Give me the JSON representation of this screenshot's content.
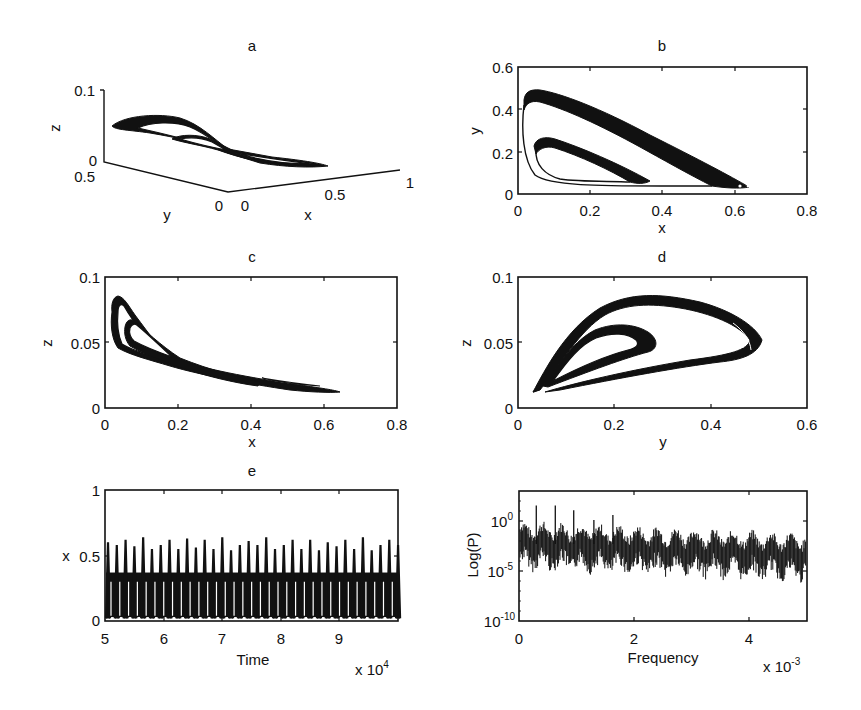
{
  "figure": {
    "panels": {
      "a": {
        "title": "a",
        "xlabel": "x",
        "ylabel": "y",
        "zlabel": "z",
        "x_ticks": [
          "0",
          "0.5",
          "1"
        ],
        "y_ticks": [
          "0",
          "0.5"
        ],
        "z_ticks": [
          "0",
          "0.1"
        ]
      },
      "b": {
        "title": "b",
        "xlabel": "x",
        "ylabel": "y",
        "x_ticks": [
          "0",
          "0.2",
          "0.4",
          "0.6",
          "0.8"
        ],
        "y_ticks": [
          "0",
          "0.2",
          "0.4",
          "0.6"
        ]
      },
      "c": {
        "title": "c",
        "xlabel": "x",
        "ylabel": "z",
        "x_ticks": [
          "0",
          "0.2",
          "0.4",
          "0.6",
          "0.8"
        ],
        "y_ticks": [
          "0",
          "0.05",
          "0.1"
        ]
      },
      "d": {
        "title": "d",
        "xlabel": "y",
        "ylabel": "z",
        "x_ticks": [
          "0",
          "0.2",
          "0.4",
          "0.6"
        ],
        "y_ticks": [
          "0",
          "0.05",
          "0.1"
        ]
      },
      "e": {
        "title": "e",
        "xlabel": "Time",
        "ylabel": "x",
        "x_multiplier": "x 10",
        "x_multiplier_exp": "4",
        "x_ticks": [
          "5",
          "6",
          "7",
          "8",
          "9"
        ],
        "y_ticks": [
          "0",
          "0.5",
          "1"
        ]
      },
      "f": {
        "title": "",
        "xlabel": "Frequency",
        "ylabel": "Log(P)",
        "x_multiplier": "x 10",
        "x_multiplier_exp": "-3",
        "x_ticks": [
          "0",
          "2",
          "4"
        ],
        "y_ticks": [
          {
            "base": "10",
            "exp": "0"
          },
          {
            "base": "10",
            "exp": "-5"
          },
          {
            "base": "10",
            "exp": "-10"
          }
        ]
      }
    }
  },
  "chart_data": [
    {
      "panel": "a",
      "type": "line",
      "title": "a",
      "description": "3D phase-space trajectory of a chaotic attractor (x, y, z)",
      "xlabel": "x",
      "ylabel": "y",
      "zlabel": "z",
      "xlim": [
        0,
        1
      ],
      "ylim": [
        0,
        0.5
      ],
      "zlim": [
        0,
        0.1
      ],
      "grid": false
    },
    {
      "panel": "b",
      "type": "line",
      "title": "b",
      "description": "Projection of attractor onto x-y plane; two nested loops",
      "xlabel": "x",
      "ylabel": "y",
      "xlim": [
        0,
        0.8
      ],
      "ylim": [
        0,
        0.6
      ],
      "grid": false,
      "outer_loop": {
        "x": [
          0.02,
          0.04,
          0.2,
          0.4,
          0.64,
          0.55,
          0.3,
          0.1,
          0.02
        ],
        "y": [
          0.4,
          0.49,
          0.4,
          0.25,
          0.04,
          0.04,
          0.05,
          0.08,
          0.4
        ]
      },
      "inner_loop": {
        "x": [
          0.05,
          0.08,
          0.2,
          0.4,
          0.35,
          0.1,
          0.05
        ],
        "y": [
          0.22,
          0.27,
          0.2,
          0.06,
          0.05,
          0.1,
          0.22
        ]
      }
    },
    {
      "panel": "c",
      "type": "line",
      "title": "c",
      "description": "Projection of attractor onto x-z plane",
      "xlabel": "x",
      "ylabel": "z",
      "xlim": [
        0,
        0.8
      ],
      "ylim": [
        0,
        0.1
      ],
      "grid": false,
      "outer_loop": {
        "x": [
          0.02,
          0.03,
          0.1,
          0.2,
          0.4,
          0.64,
          0.4,
          0.2,
          0.05,
          0.02
        ],
        "z": [
          0.07,
          0.083,
          0.055,
          0.035,
          0.025,
          0.012,
          0.015,
          0.025,
          0.045,
          0.07
        ]
      },
      "inner_loop": {
        "x": [
          0.05,
          0.06,
          0.15,
          0.38,
          0.2,
          0.06,
          0.05
        ],
        "z": [
          0.055,
          0.064,
          0.045,
          0.02,
          0.03,
          0.045,
          0.055
        ]
      }
    },
    {
      "panel": "d",
      "type": "line",
      "title": "d",
      "description": "Projection of attractor onto y-z plane",
      "xlabel": "y",
      "ylabel": "z",
      "xlim": [
        0,
        0.6
      ],
      "ylim": [
        0,
        0.1
      ],
      "grid": false,
      "outer_loop": {
        "y": [
          0.03,
          0.1,
          0.25,
          0.4,
          0.49,
          0.4,
          0.2,
          0.03
        ],
        "z": [
          0.012,
          0.06,
          0.085,
          0.07,
          0.048,
          0.037,
          0.025,
          0.012
        ]
      },
      "inner_loop": {
        "y": [
          0.05,
          0.12,
          0.2,
          0.27,
          0.2,
          0.05
        ],
        "z": [
          0.02,
          0.06,
          0.064,
          0.05,
          0.037,
          0.02
        ]
      }
    },
    {
      "panel": "e",
      "type": "line",
      "title": "e",
      "description": "Time series of x; quasi-periodic bursts with ~34 peaks between t=5e4 and 1e5",
      "xlabel": "Time (x 10^4)",
      "ylabel": "x",
      "xlim": [
        5,
        10
      ],
      "ylim": [
        0,
        1
      ],
      "grid": false,
      "x": [
        5.0,
        5.15,
        5.3,
        5.45,
        5.6,
        5.75,
        5.9,
        6.05,
        6.2,
        6.35,
        6.5,
        6.65,
        6.8,
        6.95,
        7.1,
        7.25,
        7.4,
        7.55,
        7.7,
        7.85,
        8.0,
        8.15,
        8.3,
        8.45,
        8.6,
        8.75,
        8.9,
        9.05,
        9.2,
        9.35,
        9.5,
        9.65,
        9.8,
        9.95
      ],
      "peak_values": [
        0.6,
        0.58,
        0.62,
        0.57,
        0.64,
        0.55,
        0.58,
        0.62,
        0.55,
        0.63,
        0.56,
        0.62,
        0.55,
        0.64,
        0.54,
        0.58,
        0.61,
        0.58,
        0.64,
        0.55,
        0.58,
        0.62,
        0.55,
        0.62,
        0.54,
        0.6,
        0.57,
        0.62,
        0.55,
        0.64,
        0.54,
        0.58,
        0.62,
        0.58
      ],
      "baseline_band": [
        0.03,
        0.37
      ]
    },
    {
      "panel": "f",
      "type": "line",
      "title": "",
      "description": "Power spectrum of x (log scale); broadband noise with sharp peaks at low frequencies",
      "xlabel": "Frequency (x 10^-3)",
      "ylabel": "Log(P)",
      "xlim": [
        0,
        5
      ],
      "ylim_log10": [
        -10,
        3.5
      ],
      "yscale": "log",
      "grid": false,
      "peaks": [
        {
          "freq": 0.3,
          "log10P": 2.0
        },
        {
          "freq": 0.63,
          "log10P": 2.0
        },
        {
          "freq": 0.95,
          "log10P": 1.5
        },
        {
          "freq": 1.3,
          "log10P": 0.5
        },
        {
          "freq": 1.63,
          "log10P": 1.0
        }
      ],
      "noise_floor_log10_range": [
        -4.5,
        -0.5
      ]
    }
  ]
}
